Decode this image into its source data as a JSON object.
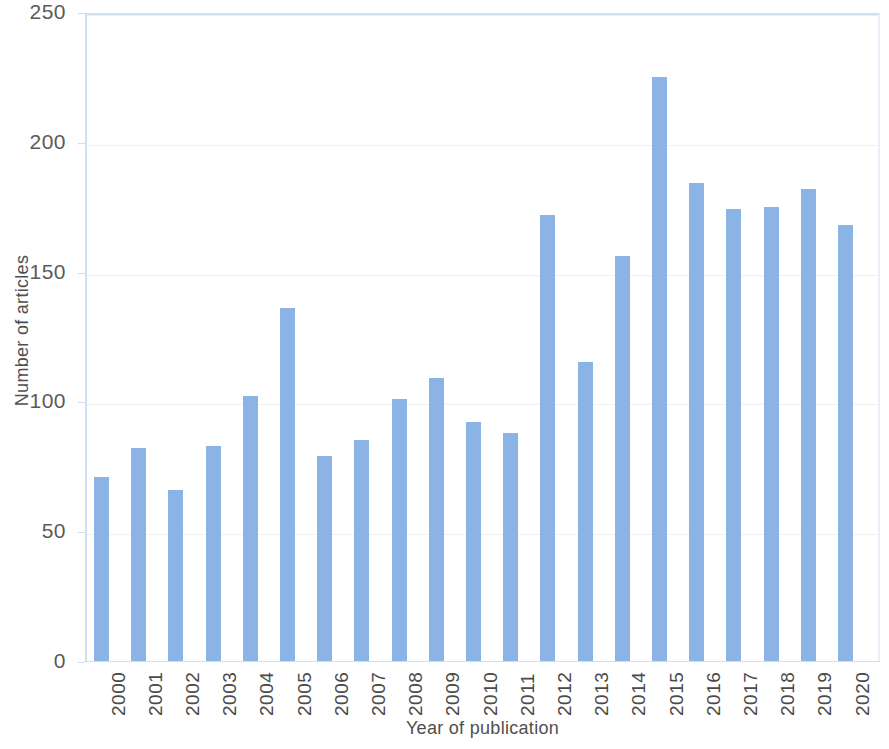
{
  "chart_data": {
    "type": "bar",
    "title": "",
    "xlabel": "Year of publication",
    "ylabel": "Number of articles",
    "categories": [
      "2000",
      "2001",
      "2002",
      "2003",
      "2004",
      "2005",
      "2006",
      "2007",
      "2008",
      "2009",
      "2010",
      "2011",
      "2012",
      "2013",
      "2014",
      "2015",
      "2016",
      "2017",
      "2018",
      "2019",
      "2020"
    ],
    "values": [
      71,
      82,
      66,
      83,
      102,
      136,
      79,
      85,
      101,
      109,
      92,
      88,
      172,
      115,
      156,
      225,
      184,
      174,
      175,
      182,
      168
    ],
    "series": [
      {
        "name": "Number of articles",
        "values": [
          71,
          82,
          66,
          83,
          102,
          136,
          79,
          85,
          101,
          109,
          92,
          88,
          172,
          115,
          156,
          225,
          184,
          174,
          175,
          182,
          168
        ]
      }
    ],
    "ylim": [
      0,
      250
    ],
    "yticks": [
      0,
      50,
      100,
      150,
      200,
      250
    ],
    "ytick_labels": [
      "0",
      "50",
      "100",
      "150",
      "200",
      "250"
    ],
    "grid": "horizontal",
    "legend": "none",
    "bar_color": "#8cb3e6",
    "gridline_color": "#f0f0f0",
    "axis_color": "#cfdff2",
    "text_color": "#4f4f4f"
  }
}
